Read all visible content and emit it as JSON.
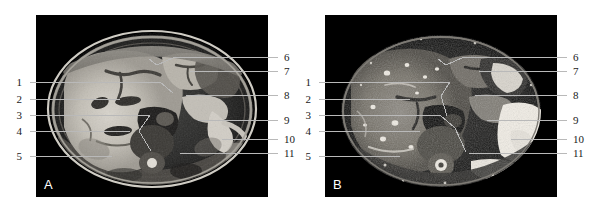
{
  "figure": {
    "width": 598,
    "height": 210,
    "background": "#ffffff",
    "type": "medical-imaging-figure"
  },
  "panels": [
    {
      "id": "A",
      "letter": "A",
      "modality": "axial-abdominal-scan",
      "rect": {
        "x": 36,
        "y": 15,
        "w": 232,
        "h": 182
      },
      "letter_pos": {
        "x": 44,
        "y": 178
      },
      "background": "#000000"
    },
    {
      "id": "B",
      "letter": "B",
      "modality": "axial-abdominal-scan",
      "rect": {
        "x": 325,
        "y": 15,
        "w": 232,
        "h": 182
      },
      "letter_pos": {
        "x": 333,
        "y": 178
      },
      "background": "#000000"
    }
  ],
  "labels": {
    "panel_a_left": [
      {
        "number": "1",
        "text_x": 22,
        "text_y": 82,
        "line": [
          [
            30,
            82
          ],
          [
            160,
            82
          ]
        ]
      },
      {
        "number": "2",
        "text_x": 22,
        "text_y": 99,
        "line": [
          [
            30,
            99
          ],
          [
            120,
            99
          ]
        ]
      },
      {
        "number": "3",
        "text_x": 22,
        "text_y": 115,
        "line": [
          [
            30,
            115
          ],
          [
            150,
            115
          ]
        ]
      },
      {
        "number": "4",
        "text_x": 22,
        "text_y": 131,
        "line": [
          [
            30,
            131
          ],
          [
            130,
            131
          ]
        ]
      },
      {
        "number": "5",
        "text_x": 22,
        "text_y": 156,
        "line": [
          [
            30,
            156
          ],
          [
            112,
            156
          ]
        ]
      }
    ],
    "panel_a_right": [
      {
        "number": "6",
        "text_x": 282,
        "text_y": 57,
        "line": [
          [
            278,
            57
          ],
          [
            175,
            57
          ],
          [
            157,
            65
          ]
        ]
      },
      {
        "number": "7",
        "text_x": 282,
        "text_y": 71,
        "line": [
          [
            278,
            71
          ],
          [
            190,
            71
          ]
        ]
      },
      {
        "number": "8",
        "text_x": 282,
        "text_y": 95,
        "line": [
          [
            278,
            95
          ],
          [
            186,
            95
          ]
        ]
      },
      {
        "number": "9",
        "text_x": 282,
        "text_y": 120,
        "line": [
          [
            278,
            120
          ],
          [
            198,
            120
          ]
        ]
      },
      {
        "number": "10",
        "text_x": 282,
        "text_y": 139,
        "line": [
          [
            278,
            139
          ],
          [
            222,
            139
          ]
        ]
      },
      {
        "number": "11",
        "text_x": 282,
        "text_y": 153,
        "line": [
          [
            278,
            153
          ],
          [
            180,
            153
          ]
        ]
      }
    ],
    "panel_b_left": [
      {
        "number": "1",
        "text_x": 311,
        "text_y": 82,
        "line": [
          [
            319,
            82
          ],
          [
            450,
            82
          ]
        ]
      },
      {
        "number": "2",
        "text_x": 311,
        "text_y": 99,
        "line": [
          [
            319,
            99
          ],
          [
            410,
            99
          ]
        ]
      },
      {
        "number": "3",
        "text_x": 311,
        "text_y": 115,
        "line": [
          [
            319,
            115
          ],
          [
            440,
            115
          ]
        ]
      },
      {
        "number": "4",
        "text_x": 311,
        "text_y": 131,
        "line": [
          [
            319,
            131
          ],
          [
            420,
            131
          ]
        ]
      },
      {
        "number": "5",
        "text_x": 311,
        "text_y": 156,
        "line": [
          [
            319,
            156
          ],
          [
            400,
            156
          ]
        ]
      }
    ],
    "panel_b_right": [
      {
        "number": "6",
        "text_x": 571,
        "text_y": 57,
        "line": [
          [
            567,
            57
          ],
          [
            464,
            57
          ],
          [
            446,
            65
          ]
        ]
      },
      {
        "number": "7",
        "text_x": 571,
        "text_y": 71,
        "line": [
          [
            567,
            71
          ],
          [
            479,
            71
          ]
        ]
      },
      {
        "number": "8",
        "text_x": 571,
        "text_y": 95,
        "line": [
          [
            567,
            95
          ],
          [
            475,
            95
          ]
        ]
      },
      {
        "number": "9",
        "text_x": 571,
        "text_y": 120,
        "line": [
          [
            567,
            120
          ],
          [
            487,
            120
          ]
        ]
      },
      {
        "number": "10",
        "text_x": 571,
        "text_y": 139,
        "line": [
          [
            567,
            139
          ],
          [
            511,
            139
          ]
        ]
      },
      {
        "number": "11",
        "text_x": 571,
        "text_y": 153,
        "line": [
          [
            567,
            153
          ],
          [
            469,
            153
          ]
        ]
      }
    ]
  },
  "internal_leaders": {
    "panel_a": [
      [
        [
          160,
          82
        ],
        [
          173,
          93
        ]
      ],
      [
        [
          150,
          115
        ],
        [
          139,
          131
        ]
      ],
      [
        [
          139,
          131
        ],
        [
          151,
          151
        ]
      ],
      [
        [
          157,
          65
        ],
        [
          149,
          59
        ]
      ]
    ],
    "panel_b": [
      [
        [
          450,
          82
        ],
        [
          441,
          96
        ]
      ],
      [
        [
          441,
          96
        ],
        [
          447,
          116
        ]
      ],
      [
        [
          440,
          115
        ],
        [
          455,
          128
        ]
      ],
      [
        [
          455,
          128
        ],
        [
          466,
          152
        ]
      ],
      [
        [
          446,
          65
        ],
        [
          438,
          59
        ]
      ]
    ]
  },
  "colors": {
    "leader_line": "#b9b9b9",
    "number_text": "#1a1a1a",
    "panel_bg": "#000000",
    "page_bg": "#ffffff",
    "letter_text": "#ffffff"
  }
}
